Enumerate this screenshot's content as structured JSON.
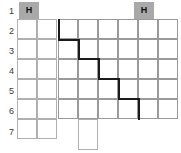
{
  "canvas": {
    "width": 181,
    "height": 153,
    "background": "#ffffff"
  },
  "colors": {
    "grid_line": "#9a9a9a",
    "grid_line_light": "#b0b0b0",
    "header_chip_bg": "#a9a9a9",
    "header_chip_text": "#111111",
    "path_stroke": "#1a1a1a",
    "row_number_text": "#3a3a3a"
  },
  "row_numbers": [
    {
      "label": "1",
      "x": 2,
      "y": 7
    },
    {
      "label": "2",
      "x": 2,
      "y": 27
    },
    {
      "label": "3",
      "x": 2,
      "y": 47
    },
    {
      "label": "4",
      "x": 2,
      "y": 67
    },
    {
      "label": "5",
      "x": 2,
      "y": 87
    },
    {
      "label": "6",
      "x": 2,
      "y": 107
    },
    {
      "label": "7",
      "x": 2,
      "y": 128
    }
  ],
  "header_chips": [
    {
      "label": "H",
      "x": 19,
      "y": 2,
      "width": 20,
      "height": 17,
      "name": "header-chip-left"
    },
    {
      "label": "H",
      "x": 134,
      "y": 2,
      "width": 20,
      "height": 17,
      "name": "header-chip-right"
    }
  ],
  "left_grid": {
    "x": 17,
    "y": 19,
    "cols": 2,
    "rows": 6,
    "cell_width": 20,
    "cell_height": 20
  },
  "main_grid": {
    "x": 58,
    "y": 19,
    "cols": 6,
    "rows": 5,
    "cell_width": 20,
    "cell_height": 20
  },
  "extra_cells": [
    {
      "x": 78,
      "y": 119,
      "width": 20,
      "height": 31,
      "name": "overflow-cell-bottom"
    }
  ],
  "staircase_path": {
    "name": "staircase-path",
    "stroke_width": 2,
    "points": [
      [
        59,
        20
      ],
      [
        59,
        40
      ],
      [
        79,
        40
      ],
      [
        79,
        59
      ],
      [
        99,
        59
      ],
      [
        99,
        79
      ],
      [
        119,
        79
      ],
      [
        119,
        99
      ],
      [
        139,
        99
      ],
      [
        139,
        119
      ]
    ]
  }
}
